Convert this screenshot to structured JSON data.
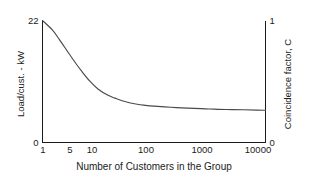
{
  "chart_data": {
    "type": "line",
    "title": "",
    "subtitle": "",
    "xlabel": "Number of Customers in the Group",
    "ylabel": "Load/cust. - kW",
    "ylabel_right": "Coincidence factor, C",
    "xscale": "log",
    "xlim": [
      1,
      10000
    ],
    "ylim": [
      0,
      22
    ],
    "ylim_right": [
      0,
      1
    ],
    "grid": false,
    "legend": false,
    "legend_position": "none",
    "xticks": [
      1,
      5,
      10,
      100,
      1000,
      10000
    ],
    "xticklabels": [
      "1",
      "5",
      "10",
      "100",
      "1000",
      "10000"
    ],
    "yticks": [
      0,
      22
    ],
    "yticklabels": [
      "0",
      "22"
    ],
    "yticks_right": [
      0,
      1
    ],
    "yticklabels_right": [
      "0",
      "1"
    ],
    "series": [
      {
        "name": "Load per customer",
        "x": [
          1,
          1.5,
          2,
          3,
          4,
          5,
          7,
          10,
          15,
          20,
          30,
          50,
          70,
          100,
          200,
          400,
          700,
          1000,
          2000,
          4000,
          7000,
          10000
        ],
        "values": [
          22,
          20.3,
          18.6,
          16.0,
          14.2,
          12.9,
          11.1,
          9.6,
          8.5,
          8.0,
          7.4,
          6.9,
          6.7,
          6.55,
          6.35,
          6.2,
          6.1,
          6.05,
          5.95,
          5.9,
          5.85,
          5.8
        ],
        "values_right": [
          1.0,
          0.923,
          0.845,
          0.727,
          0.645,
          0.586,
          0.505,
          0.436,
          0.386,
          0.364,
          0.336,
          0.314,
          0.305,
          0.298,
          0.289,
          0.282,
          0.277,
          0.275,
          0.27,
          0.268,
          0.266,
          0.264
        ]
      }
    ],
    "colors": {
      "curve": "#4a4a4a",
      "axis": "#1b1b1b",
      "background": "#ffffff"
    }
  },
  "axes": {
    "left": {
      "title": "Load/cust. - kW",
      "top_tick": "22",
      "bottom_tick": "0"
    },
    "right": {
      "title": "Coincidence factor, C",
      "top_tick": "1",
      "bottom_tick": "0"
    },
    "bottom": {
      "title": "Number of Customers in the Group",
      "ticks": [
        "1",
        "5",
        "10",
        "100",
        "1000",
        "10000"
      ]
    }
  }
}
